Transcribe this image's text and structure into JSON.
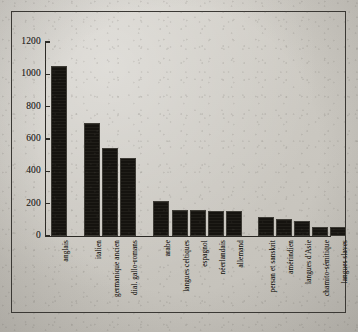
{
  "chart_data": {
    "type": "bar",
    "title": "",
    "subtitle": "",
    "xlabel": "",
    "ylabel": "",
    "ylim": [
      0,
      1200
    ],
    "yticks": [
      0,
      200,
      400,
      600,
      800,
      1000,
      1200
    ],
    "ytick_labels": [
      "0",
      "200",
      "400",
      "600",
      "800",
      "1000",
      "1200"
    ],
    "grid": false,
    "legend": null,
    "bar_color": "#191712",
    "axis_color": "#2b2925",
    "background_color": "#cbc8c1",
    "categories": [
      "anglais",
      "italien",
      "germanique ancien",
      "dial. gallo-romans",
      "arabe",
      "langues celtiques",
      "espagnol",
      "néerlandais",
      "allemand",
      "persan et sanskrit",
      "amérindien",
      "langues d'Asie",
      "chamito-sémitique",
      "langues slaves"
    ],
    "values": [
      1050,
      700,
      545,
      480,
      215,
      160,
      160,
      155,
      152,
      115,
      108,
      90,
      55,
      55
    ],
    "bars": [
      {
        "label": "anglais",
        "value": 1050,
        "x": 51,
        "width": 16
      },
      {
        "label": "italien",
        "value": 700,
        "x": 84,
        "width": 16
      },
      {
        "label": "germanique ancien",
        "value": 545,
        "x": 102,
        "width": 16
      },
      {
        "label": "dial. gallo-romans",
        "value": 480,
        "x": 120,
        "width": 16
      },
      {
        "label": "arabe",
        "value": 215,
        "x": 153,
        "width": 16
      },
      {
        "label": "langues celtiques",
        "value": 160,
        "x": 172,
        "width": 16
      },
      {
        "label": "espagnol",
        "value": 160,
        "x": 190,
        "width": 16
      },
      {
        "label": "néerlandais",
        "value": 155,
        "x": 208,
        "width": 16
      },
      {
        "label": "allemand",
        "value": 152,
        "x": 226,
        "width": 16
      },
      {
        "label": "persan et sanskrit",
        "value": 115,
        "x": 258,
        "width": 16
      },
      {
        "label": "amérindien",
        "value": 108,
        "x": 276,
        "width": 16
      },
      {
        "label": "langues d'Asie",
        "value": 90,
        "x": 294,
        "width": 16
      },
      {
        "label": "chamito-sémitique",
        "value": 55,
        "x": 312,
        "width": 16
      },
      {
        "label": "langues slaves",
        "value": 55,
        "x": 330,
        "width": 16
      }
    ]
  }
}
